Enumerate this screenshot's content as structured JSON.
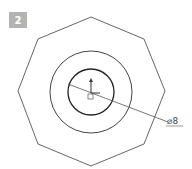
{
  "figure": {
    "step_badge": "2",
    "dimension_label": "⌀8",
    "colors": {
      "badge_bg": "#b3b3b3",
      "badge_text": "#ffffff",
      "outline": "#555555",
      "circle": "#333333",
      "background": "#ffffff"
    },
    "shapes": {
      "octagon": "outer octagon outline",
      "outer_circle": "outer concentric circle",
      "inner_circle": "inner circle (sketch)",
      "origin_marker": "origin axis marker",
      "dimension_line": "diameter dimension leader"
    }
  }
}
